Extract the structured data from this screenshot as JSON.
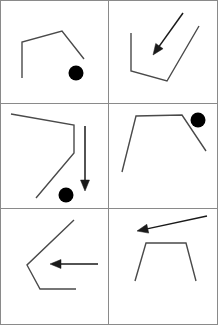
{
  "sheet": {
    "title": "Line drawing stimulus sheet",
    "width": 218,
    "height": 325,
    "background_color": "#ffffff",
    "stroke_color": "#4a4a4a",
    "arrow_color": "#1a1a1a",
    "dot_color": "#000000",
    "divider_color": "#8a8a8a",
    "columns": 2,
    "rows": 3,
    "panel_count": 6
  },
  "grid": {
    "vertical_dividers": [
      108.5
    ],
    "horizontal_dividers": [
      103.5,
      208.5
    ],
    "border": {
      "x": 0.5,
      "y": 0.5,
      "width": 217,
      "height": 324
    }
  },
  "panels": [
    {
      "id": "panel-1",
      "index": 1,
      "label": "top-left",
      "x": 0,
      "y": 0,
      "width": 108,
      "height": 103,
      "shape": {
        "name": "open-polyline-peak",
        "points": "22,78 22,42 62,31 84,59",
        "stroke_width": 1.4
      },
      "dot": {
        "cx": 76,
        "cy": 73,
        "r": 7.5
      },
      "arrow": null
    },
    {
      "id": "panel-2",
      "index": 2,
      "label": "top-right",
      "x": 109,
      "y": 0,
      "width": 109,
      "height": 103,
      "shape": {
        "name": "open-polyline-vee",
        "points": "131,33 131,71 167,81 199,26",
        "stroke_width": 1.4
      },
      "dot": null,
      "arrow": {
        "name": "arrow-down-left",
        "x1": 183,
        "y1": 13,
        "x2": 153,
        "y2": 55,
        "stroke_width": 1.5,
        "head_length": 11,
        "head_width": 9
      }
    },
    {
      "id": "panel-3",
      "index": 3,
      "label": "middle-left",
      "x": 0,
      "y": 104,
      "width": 108,
      "height": 104,
      "shape": {
        "name": "open-polyline-zigzag",
        "points": "11,114 74,125 74,153 36,198",
        "stroke_width": 1.4
      },
      "dot": {
        "cx": 66,
        "cy": 195,
        "r": 7.5
      },
      "arrow": {
        "name": "arrow-down",
        "x1": 85,
        "y1": 126,
        "x2": 85,
        "y2": 191,
        "stroke_width": 1.5,
        "head_length": 11,
        "head_width": 9
      }
    },
    {
      "id": "panel-4",
      "index": 4,
      "label": "middle-right",
      "x": 109,
      "y": 104,
      "width": 109,
      "height": 104,
      "shape": {
        "name": "open-polyline-plateau",
        "points": "122,172 136,116 182,115 206,151",
        "stroke_width": 1.4
      },
      "dot": {
        "cx": 198,
        "cy": 120,
        "r": 7.5
      },
      "arrow": null
    },
    {
      "id": "panel-5",
      "index": 5,
      "label": "bottom-left",
      "x": 0,
      "y": 209,
      "width": 108,
      "height": 116,
      "shape": {
        "name": "open-polyline-arrowhead-outline",
        "points": "74,220 27,265 40,289 76,289",
        "stroke_width": 1.4
      },
      "dot": null,
      "arrow": {
        "name": "arrow-left",
        "x1": 98,
        "y1": 264,
        "x2": 50,
        "y2": 264,
        "stroke_width": 1.5,
        "head_length": 11,
        "head_width": 9
      }
    },
    {
      "id": "panel-6",
      "index": 6,
      "label": "bottom-right",
      "x": 109,
      "y": 209,
      "width": 109,
      "height": 116,
      "shape": {
        "name": "open-polyline-trapezoid",
        "points": "135,281 146,243 186,243 196,281",
        "stroke_width": 1.4
      },
      "dot": null,
      "arrow": {
        "name": "arrow-up-left",
        "x1": 207,
        "y1": 216,
        "x2": 137,
        "y2": 231,
        "stroke_width": 1.5,
        "head_length": 11,
        "head_width": 9
      }
    }
  ]
}
